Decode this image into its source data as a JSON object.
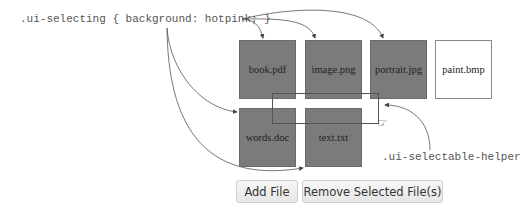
{
  "annotations": {
    "selecting_css": ".ui-selecting { background: hotpink; }",
    "helper_class": ".ui-selectable-helper"
  },
  "files": [
    {
      "name": "book.pdf",
      "state": "selecting"
    },
    {
      "name": "image.png",
      "state": "selecting"
    },
    {
      "name": "portrait.jpg",
      "state": "selecting"
    },
    {
      "name": "paint.bmp",
      "state": "unselected"
    },
    {
      "name": "words.doc",
      "state": "selecting"
    },
    {
      "name": "text.txt",
      "state": "selecting"
    }
  ],
  "buttons": {
    "add_file": "Add File",
    "remove_selected": "Remove Selected File(s)"
  },
  "colors": {
    "selected_fill": "#7b7b7b",
    "unselected_fill": "#ffffff",
    "annotation_text": "#555555"
  },
  "icons": {
    "cursor": "hand-pointer-icon"
  }
}
